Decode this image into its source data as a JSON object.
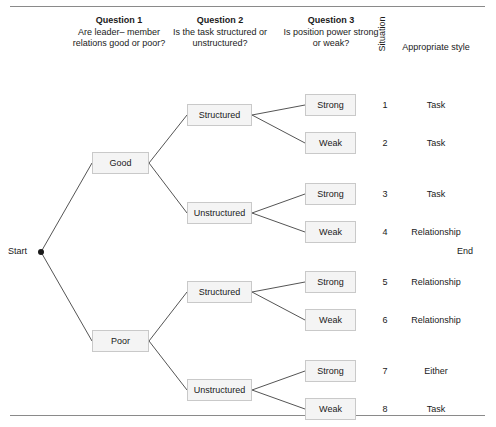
{
  "figure": {
    "headers": {
      "q1": {
        "title": "Question 1",
        "subtitle": "Are leader– member relations good or poor?"
      },
      "q2": {
        "title": "Question 2",
        "subtitle": "Is the task structured or unstructured?"
      },
      "q3": {
        "title": "Question 3",
        "subtitle": "Is position power strong or weak?"
      },
      "situation": "Situation",
      "style": "Appropriate style"
    },
    "endpoints": {
      "start": "Start",
      "end": "End"
    },
    "level1": [
      {
        "label": "Good"
      },
      {
        "label": "Poor"
      }
    ],
    "level2": [
      {
        "label": "Structured"
      },
      {
        "label": "Unstructured"
      },
      {
        "label": "Structured"
      },
      {
        "label": "Unstructured"
      }
    ],
    "leaves": [
      {
        "power": "Strong",
        "situation": "1",
        "style": "Task"
      },
      {
        "power": "Weak",
        "situation": "2",
        "style": "Task"
      },
      {
        "power": "Strong",
        "situation": "3",
        "style": "Task"
      },
      {
        "power": "Weak",
        "situation": "4",
        "style": "Relationship"
      },
      {
        "power": "Strong",
        "situation": "5",
        "style": "Relationship"
      },
      {
        "power": "Weak",
        "situation": "6",
        "style": "Relationship"
      },
      {
        "power": "Strong",
        "situation": "7",
        "style": "Either"
      },
      {
        "power": "Weak",
        "situation": "8",
        "style": "Task"
      }
    ],
    "colors": {
      "box_fill": "#f4f4f4",
      "box_border": "#c9c9c9",
      "connector": "#555555",
      "rule": "#8a8a8a",
      "text": "#1a1a1a"
    }
  }
}
